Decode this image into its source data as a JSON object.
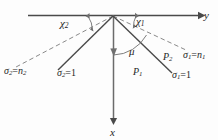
{
  "figure": {
    "name": "refraction-ray-diagram",
    "background_color": "#fdfdfd",
    "ink_color": "#3a3a3a",
    "width": 218,
    "height": 140
  },
  "axes": {
    "horizontal": {
      "label": "y",
      "arrow_direction": "right"
    },
    "vertical": {
      "label": "x",
      "arrow_direction": "down"
    }
  },
  "angles": [
    {
      "id": "chi2",
      "label": "χ",
      "sub": "2",
      "side": "left"
    },
    {
      "id": "chi1",
      "label": "χ",
      "sub": "1",
      "side": "right"
    },
    {
      "id": "mu",
      "label": "μ",
      "sub": "",
      "side": "right-inner"
    }
  ],
  "rays": [
    {
      "id": "ray-sigma2-n2",
      "style": "dashed",
      "label_sigma": "σ",
      "label_sub": "2",
      "label_eq": "=",
      "label_val": "n",
      "label_val_sub": "2"
    },
    {
      "id": "ray-sigma2-1",
      "style": "solid",
      "label_sigma": "σ",
      "label_sub": "2",
      "label_eq": "=",
      "label_val": "1",
      "label_val_sub": ""
    },
    {
      "id": "ray-sigma1-n1",
      "style": "dashed",
      "label_sigma": "σ",
      "label_sub": "1",
      "label_eq": "=",
      "label_val": "n",
      "label_val_sub": "1"
    },
    {
      "id": "ray-sigma1-1",
      "style": "solid",
      "label_sigma": "σ",
      "label_sub": "1",
      "label_eq": "=",
      "label_val": "1",
      "label_val_sub": ""
    }
  ],
  "points": [
    {
      "id": "P1",
      "label": "P",
      "sub": "1"
    },
    {
      "id": "P2",
      "label": "P",
      "sub": "2"
    }
  ]
}
